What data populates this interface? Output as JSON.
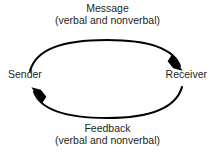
{
  "diagram": {
    "type": "communication-cycle",
    "background_color": "#ffffff",
    "text_color": "#231f20",
    "stroke_color": "#000000",
    "nodes": {
      "sender": "Sender",
      "receiver": "Receiver"
    },
    "top_flow": {
      "title": "Message",
      "subtitle": "(verbal and nonverbal)",
      "direction": "sender-to-receiver"
    },
    "bottom_flow": {
      "title": "Feedback",
      "subtitle": "(verbal and nonverbal)",
      "direction": "receiver-to-sender"
    },
    "icons": {
      "top_arrow": "curved-arrow-right-icon",
      "bottom_arrow": "curved-arrow-left-icon"
    }
  }
}
